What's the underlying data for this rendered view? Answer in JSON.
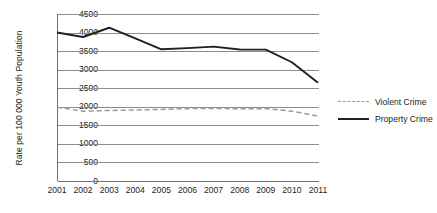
{
  "chart_data": {
    "type": "line",
    "title": "",
    "xlabel": "",
    "ylabel": "Rate per 100 000 Youth Population",
    "categories": [
      "2001",
      "2002",
      "2003",
      "2004",
      "2005",
      "2006",
      "2007",
      "2008",
      "2009",
      "2010",
      "2011"
    ],
    "ylim": [
      0,
      4500
    ],
    "ytick_step": 500,
    "yticks": [
      "4500",
      "4000",
      "3500",
      "3000",
      "2500",
      "2000",
      "1500",
      "1000",
      "500",
      "0"
    ],
    "grid": "horizontal",
    "legend_position": "right",
    "series": [
      {
        "name": "Violent Crime",
        "style": "dashed",
        "color": "#9b9b9b",
        "values": [
          1990,
          1880,
          1900,
          1915,
          1930,
          1950,
          1955,
          1945,
          1950,
          1880,
          1750
        ]
      },
      {
        "name": "Property Crime",
        "style": "solid",
        "color": "#231f20",
        "values": [
          4000,
          3880,
          4130,
          3840,
          3550,
          3580,
          3620,
          3545,
          3540,
          3200,
          2650
        ]
      }
    ]
  },
  "legend": {
    "items": [
      {
        "label": "Violent Crime"
      },
      {
        "label": "Property Crime"
      }
    ]
  }
}
